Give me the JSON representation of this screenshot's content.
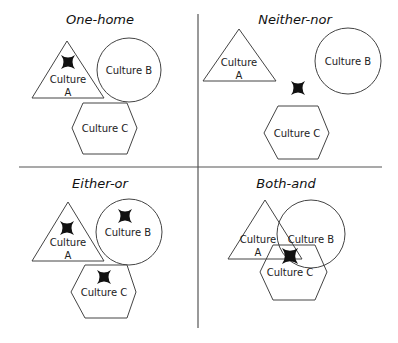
{
  "diagram": {
    "quadrants": [
      {
        "id": "one-home",
        "title": "One-home",
        "culture_a": [
          "Culture",
          "A"
        ],
        "culture_b": "Culture B",
        "culture_c": "Culture C",
        "marks": [
          "in Culture A"
        ]
      },
      {
        "id": "neither-nor",
        "title": "Neither-nor",
        "culture_a": [
          "Culture",
          "A"
        ],
        "culture_b": "Culture B",
        "culture_c": "Culture C",
        "marks": [
          "outside all cultures"
        ]
      },
      {
        "id": "either-or",
        "title": "Either-or",
        "culture_a": [
          "Culture",
          "A"
        ],
        "culture_b": "Culture B",
        "culture_c": "Culture C",
        "marks": [
          "in Culture A",
          "in Culture B",
          "in Culture C"
        ]
      },
      {
        "id": "both-and",
        "title": "Both-and",
        "culture_a": [
          "Culture",
          "A"
        ],
        "culture_b": "Culture B",
        "culture_c": "Culture C",
        "marks": [
          "intersection of A, B and C"
        ]
      }
    ],
    "colors": {
      "stroke": "#444444",
      "mark": "#111111",
      "background": "#ffffff"
    }
  }
}
